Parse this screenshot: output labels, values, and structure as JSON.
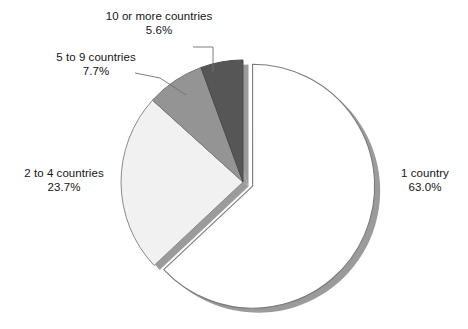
{
  "chart_data": {
    "type": "pie",
    "title": "",
    "subtitle": "",
    "xlabel": "",
    "ylabel": "",
    "legend_position": "none",
    "grid": false,
    "labels_show_percent": true,
    "categories": [
      "1 country",
      "2 to 4 countries",
      "5 to 9 countries",
      "10 or more countries"
    ],
    "values": [
      63.0,
      23.7,
      7.7,
      5.6
    ],
    "value_labels": [
      "63.0%",
      "23.7%",
      "7.7%",
      "5.6%"
    ],
    "total": 100.0,
    "units": "percent",
    "slices": [
      {
        "name": "1 country",
        "value": 63.0,
        "value_label": "63.0%",
        "color": "#ffffff",
        "edge_color": "#7a7a7a",
        "exploded": true,
        "shadow": true
      },
      {
        "name": "2 to 4 countries",
        "value": 23.7,
        "value_label": "23.7%",
        "color": "#f1f1f1",
        "edge_color": "#8a8a8a",
        "exploded": false,
        "shadow": true
      },
      {
        "name": "5 to 9 countries",
        "value": 7.7,
        "value_label": "7.7%",
        "color": "#949494",
        "edge_color": "#7a7a7a",
        "exploded": false,
        "shadow": true
      },
      {
        "name": "10 or more countries",
        "value": 5.6,
        "value_label": "5.6%",
        "color": "#565656",
        "edge_color": "#4a4a4a",
        "exploded": false,
        "shadow": true
      }
    ],
    "start_angle_deg": 0,
    "direction": "clockwise"
  },
  "labels": {
    "ten_or_more": {
      "name": "10 or more countries",
      "percent": "5.6%"
    },
    "five_to_nine": {
      "name": "5 to 9 countries",
      "percent": "7.7%"
    },
    "two_to_four": {
      "name": "2 to 4 countries",
      "percent": "23.7%"
    },
    "one_country": {
      "name": "1 country",
      "percent": "63.0%"
    }
  },
  "colors": {
    "background": "#ffffff",
    "text": "#141414",
    "leader_line": "#6f6f6f",
    "slice_one_country": "#ffffff",
    "slice_two_to_four": "#f1f1f1",
    "slice_five_to_nine": "#949494",
    "slice_ten_or_more": "#565656",
    "shadow": "#9b9b9b"
  }
}
